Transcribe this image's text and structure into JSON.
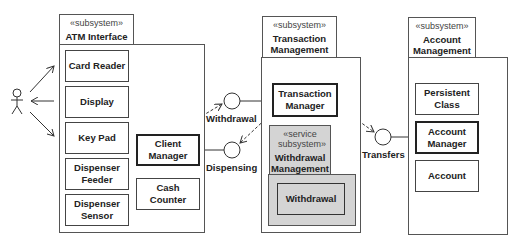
{
  "actor": {
    "name": "user-actor"
  },
  "subsystems": {
    "atm": {
      "stereotype": "«subsystem»",
      "title": "ATM Interface",
      "components": {
        "card_reader": "Card Reader",
        "display": "Display",
        "key_pad": "Key Pad",
        "dispenser_feeder": "Dispenser Feeder",
        "dispenser_sensor": "Dispenser Sensor",
        "client_manager": "Client Manager",
        "cash_counter": "Cash Counter"
      }
    },
    "transaction": {
      "stereotype": "«subsystem»",
      "title": "Transaction Management",
      "components": {
        "transaction_manager": "Transaction Manager"
      },
      "service": {
        "stereotype": "«service subsystem»",
        "title": "Withdrawal Management",
        "component": "Withdrawal"
      }
    },
    "account": {
      "stereotype": "«subsystem»",
      "title": "Account Management",
      "components": {
        "persistent_class": "Persistent Class",
        "account_manager": "Account Manager",
        "account": "Account"
      }
    }
  },
  "interfaces": {
    "withdrawal": "Withdrawal",
    "dispensing": "Dispensing",
    "transfers": "Transfers"
  }
}
